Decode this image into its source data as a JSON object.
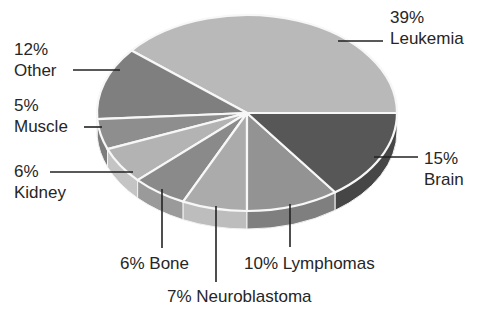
{
  "chart_data": {
    "type": "pie",
    "style": "3d-exploded-none",
    "title": "",
    "start_angle_deg": 0,
    "direction": "counterclockwise",
    "slices": [
      {
        "name": "Leukemia",
        "value": 39,
        "label": "39%\nLeukemia",
        "color": "#b9b9b9",
        "side": "#a8a8a8"
      },
      {
        "name": "Other",
        "value": 12,
        "label": "12%\nOther",
        "color": "#7f7f7f",
        "side": "#6e6e6e"
      },
      {
        "name": "Muscle",
        "value": 5,
        "label": "5%\nMuscle",
        "color": "#8e8e8e",
        "side": "#7c7c7c"
      },
      {
        "name": "Kidney",
        "value": 6,
        "label": "6%\nKidney",
        "color": "#b3b3b3",
        "side": "#c4c4c4"
      },
      {
        "name": "Bone",
        "value": 6,
        "label": "6% Bone",
        "color": "#8a8a8a",
        "side": "#9a9a9a"
      },
      {
        "name": "Neuroblastoma",
        "value": 7,
        "label": "7% Neuroblastoma",
        "color": "#ababab",
        "side": "#bdbdbd"
      },
      {
        "name": "Lymphomas",
        "value": 10,
        "label": "10% Lymphomas",
        "color": "#939393",
        "side": "#7f7f7f"
      },
      {
        "name": "Brain",
        "value": 15,
        "label": "15%\nBrain",
        "color": "#575757",
        "side": "#464646"
      }
    ]
  },
  "labels": {
    "leukemia": {
      "pct": "39%",
      "name": "Leukemia"
    },
    "other": {
      "pct": "12%",
      "name": "Other"
    },
    "muscle": {
      "pct": "5%",
      "name": "Muscle"
    },
    "kidney": {
      "pct": "6%",
      "name": "Kidney"
    },
    "bone": "6% Bone",
    "neuroblastoma": "7% Neuroblastoma",
    "lymphomas": "10% Lymphomas",
    "brain": {
      "pct": "15%",
      "name": "Brain"
    }
  }
}
